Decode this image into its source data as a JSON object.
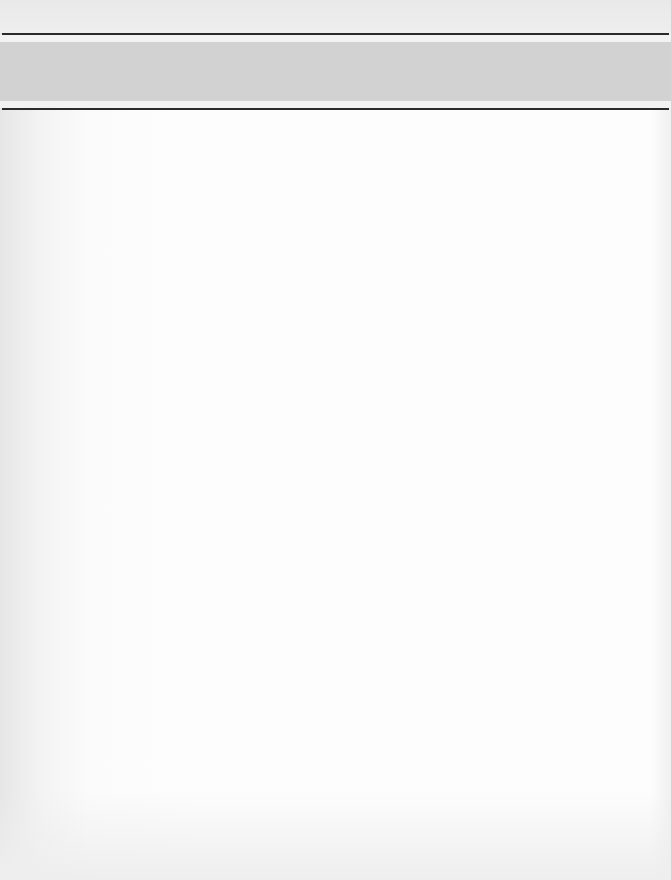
{
  "page": {
    "type": "scanned-blank-page",
    "header_band": {
      "text": "",
      "color": "#d2d2d2"
    },
    "rules": {
      "color": "#2a2a2a"
    },
    "body_text": "",
    "background_color": "#fdfdfd"
  }
}
